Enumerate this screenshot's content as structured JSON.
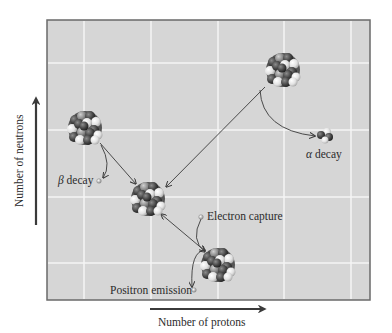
{
  "figure": {
    "type": "nuclear-decay-diagram",
    "x_axis_label": "Number of protons",
    "y_axis_label": "Number of neutrons",
    "colors": {
      "plot_background": "#d6d6d6",
      "gridline": "#f4f4f4",
      "frame": "#6a6a6a",
      "arrow": "#3a3a3a",
      "nucleon_dark": "#3c3c3c",
      "nucleon_mid": "#8a8a8a",
      "nucleon_light": "#e6e6e6"
    },
    "labels": {
      "beta": {
        "symbol": "β",
        "text": " decay"
      },
      "alpha": {
        "symbol": "α",
        "text": " decay"
      },
      "electron_capture": "Electron capture",
      "positron_emission": "Positron emission"
    },
    "nuclei": [
      {
        "id": "beta-parent",
        "cx": 85,
        "cy": 128,
        "r": 19
      },
      {
        "id": "daughter-center",
        "cx": 148,
        "cy": 199,
        "r": 18
      },
      {
        "id": "alpha-parent",
        "cx": 283,
        "cy": 70,
        "r": 18
      },
      {
        "id": "ec-pe-parent",
        "cx": 218,
        "cy": 265,
        "r": 18
      }
    ],
    "transitions": [
      {
        "from": "beta-parent",
        "to": "daughter-center",
        "process": "β decay"
      },
      {
        "from": "alpha-parent",
        "to": "daughter-center",
        "process": "α decay"
      },
      {
        "from": "ec-pe-parent",
        "to": "daughter-center",
        "process": "Electron capture / Positron emission"
      }
    ]
  }
}
